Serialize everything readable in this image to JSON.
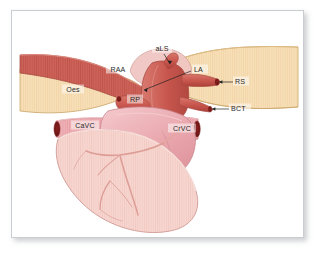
{
  "figure": {
    "frame": {
      "border_color": "#c9ccd1",
      "background": "#ffffff",
      "shadow_color": "#787e86"
    },
    "palette": {
      "vessel_red": "#c9584f",
      "vessel_red_light": "#d97a6e",
      "vessel_red_dark": "#a63f3a",
      "vessel_lumen": "#7a1d1d",
      "oesophagus_tan": "#f2d7ab",
      "oesophagus_tan_light": "#fae4c4",
      "oesophagus_edge": "#c9a468",
      "atrium_pink": "#e9a7ad",
      "atrium_pink_light": "#f2c2c6",
      "ventricle_pink": "#f5cfc9",
      "ventricle_pink_light": "#fadfda",
      "coronary_pink": "#dd9d95",
      "outline": "#b07a74",
      "label_text": "#2b2b2b"
    },
    "labels": [
      {
        "id": "aLS",
        "text": "aLS",
        "x": 150,
        "y": 39,
        "anchor": "middle",
        "note": "left subclavian artery"
      },
      {
        "id": "RAA",
        "text": "RAA",
        "x": 106,
        "y": 60,
        "anchor": "middle",
        "note": "right azygos / aortic arch region"
      },
      {
        "id": "LA",
        "text": "LA",
        "x": 181,
        "y": 60,
        "anchor": "start",
        "note": "left atrium"
      },
      {
        "id": "RS",
        "text": "RS",
        "x": 223,
        "y": 72,
        "anchor": "start",
        "note": "right subclavian artery"
      },
      {
        "id": "BCT",
        "text": "BCT",
        "x": 219,
        "y": 99,
        "anchor": "start",
        "note": "brachiocephalic trunk"
      },
      {
        "id": "Oes",
        "text": "Oes",
        "x": 61,
        "y": 80,
        "anchor": "middle",
        "note": "oesophagus"
      },
      {
        "id": "RP",
        "text": "RP",
        "x": 123,
        "y": 90,
        "anchor": "middle",
        "note": "right pulmonary vessel"
      },
      {
        "id": "CaVC",
        "text": "CaVC",
        "x": 73,
        "y": 116,
        "anchor": "middle",
        "note": "caudal vena cava"
      },
      {
        "id": "CrVC",
        "text": "CrVC",
        "x": 170,
        "y": 119,
        "anchor": "middle",
        "note": "cranial vena cava"
      }
    ],
    "leaders": [
      {
        "id": "aLS-leader",
        "d": "M 152 43 L 158 53"
      },
      {
        "id": "LA-leader",
        "d": "M 179 60 L 132 79"
      },
      {
        "id": "RS-leader",
        "d": "M 221 71 L 206 71"
      },
      {
        "id": "BCT-leader",
        "d": "M 217 98 L 199 98"
      }
    ],
    "structures": [
      {
        "id": "oesophagus-left",
        "label": "Oes",
        "color": "#f2d7ab"
      },
      {
        "id": "oesophagus-right",
        "label": "",
        "color": "#f7dfb8"
      },
      {
        "id": "aorta-arch",
        "label": "RAA",
        "color": "#c9584f"
      },
      {
        "id": "left-atrium",
        "label": "LA",
        "color": "#c9584f"
      },
      {
        "id": "subclavian-right",
        "label": "RS",
        "color": "#c9584f"
      },
      {
        "id": "brachioceph-trunk",
        "label": "BCT",
        "color": "#c9584f"
      },
      {
        "id": "pulmonary-right",
        "label": "RP",
        "color": "#c9584f"
      },
      {
        "id": "caudal-vena-cava",
        "label": "CaVC",
        "color": "#e9a7ad"
      },
      {
        "id": "cranial-vena-cava",
        "label": "CrVC",
        "color": "#d98c86"
      },
      {
        "id": "atrium-body",
        "label": "",
        "color": "#e9a7ad"
      },
      {
        "id": "ventricle-body",
        "label": "",
        "color": "#f5cfc9"
      }
    ]
  }
}
